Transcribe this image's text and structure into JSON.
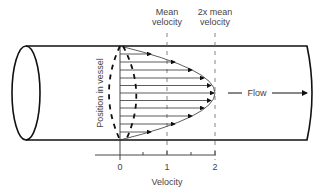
{
  "title_labels": {
    "mean": [
      "Mean",
      "velocity"
    ],
    "two_x_mean": [
      "2x mean",
      "velocity"
    ]
  },
  "y_axis_label": "Position in vessel",
  "flow_label": "Flow",
  "x_axis": {
    "label": "Velocity",
    "ticks": [
      "0",
      "1",
      "2"
    ]
  },
  "colors": {
    "line": "#111111",
    "grid": "#666666",
    "text": "#444444"
  }
}
